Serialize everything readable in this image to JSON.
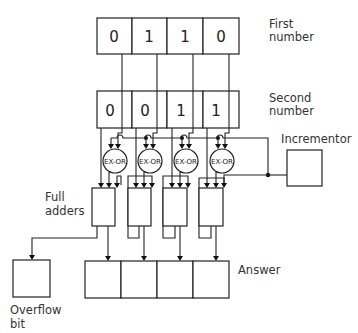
{
  "labels": {
    "first_number_line1": "First",
    "first_number_line2": "number",
    "second_number_line1": "Second",
    "second_number_line2": "number",
    "incrementor": "Incrementor",
    "full_adders_line1": "Full",
    "full_adders_line2": "adders",
    "answer": "Answer",
    "overflow_line1": "Overflow",
    "overflow_line2": "bit"
  },
  "first_number": {
    "bits": [
      "0",
      "1",
      "1",
      "0"
    ]
  },
  "second_number": {
    "bits": [
      "0",
      "0",
      "1",
      "1"
    ]
  },
  "gates": {
    "label": "EX-OR",
    "count": 4
  },
  "answer": {
    "bits": [
      "",
      "",
      "",
      ""
    ]
  },
  "overflow": {
    "value": ""
  }
}
